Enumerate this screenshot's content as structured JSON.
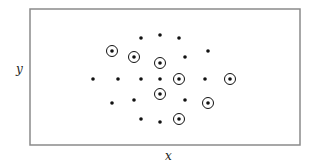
{
  "chart_data": {
    "type": "scatter",
    "title": "",
    "xlabel": "x",
    "ylabel": "y",
    "grid": false,
    "legend": null,
    "frame": {
      "left": 30,
      "top": 9,
      "right": 300,
      "bottom": 145
    },
    "series": [
      {
        "name": "plain points",
        "marker": "dot",
        "points": [
          [
            141,
            38
          ],
          [
            160,
            35
          ],
          [
            179,
            38
          ],
          [
            208,
            51
          ],
          [
            185,
            57
          ],
          [
            93,
            79
          ],
          [
            118,
            79
          ],
          [
            141,
            79
          ],
          [
            160,
            79
          ],
          [
            205,
            79
          ],
          [
            112,
            103
          ],
          [
            134,
            100
          ],
          [
            185,
            100
          ],
          [
            141,
            119
          ],
          [
            160,
            122
          ]
        ]
      },
      {
        "name": "circled points",
        "marker": "circled-dot",
        "points": [
          [
            112,
            51
          ],
          [
            134,
            57
          ],
          [
            160,
            63
          ],
          [
            179,
            79
          ],
          [
            230,
            79
          ],
          [
            160,
            94
          ],
          [
            208,
            103
          ],
          [
            179,
            119
          ]
        ]
      }
    ],
    "colors": {
      "frame": "#8a8a8a",
      "point": "#111111"
    }
  }
}
